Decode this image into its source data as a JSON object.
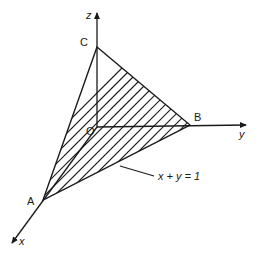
{
  "diagram": {
    "type": "3d-coordinate-plane",
    "axes": {
      "x": {
        "label": "x"
      },
      "y": {
        "label": "y"
      },
      "z": {
        "label": "z"
      }
    },
    "points": {
      "origin": {
        "label": "O"
      },
      "A": {
        "label": "A"
      },
      "B": {
        "label": "B"
      },
      "C": {
        "label": "C"
      }
    },
    "annotation": {
      "label": "x + y = 1"
    },
    "shaded_region": "triangle ABC (hatched)",
    "colors": {
      "ink": "#1a1a1a",
      "background": "#ffffff"
    }
  }
}
